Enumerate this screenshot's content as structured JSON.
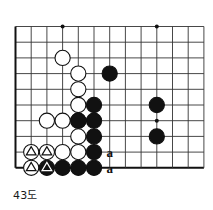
{
  "diagram": {
    "caption": "43도",
    "kind": "go-board-diagram",
    "board": {
      "cols": 12,
      "rows": 10,
      "origin_x": 15.5,
      "origin_y": 26.5,
      "spacing": 15.7,
      "line_color": "#333333",
      "edge_color": "#111111",
      "edge_width": 2.0,
      "line_width": 0.9,
      "edges": {
        "left": true,
        "top": false,
        "right": false,
        "bottom": true
      },
      "star_points": [
        {
          "col": 3,
          "row": 0
        },
        {
          "col": 9,
          "row": 0
        },
        {
          "col": 9,
          "row": 6
        }
      ],
      "star_radius": 2.0,
      "star_color": "#111111"
    },
    "stones": {
      "white_fill": "#ffffff",
      "white_stroke": "#111111",
      "black_fill": "#111111",
      "black_stroke": "#111111",
      "radius": 7.6,
      "list": [
        {
          "col": 3,
          "row": 2,
          "color": "white",
          "mark": "none"
        },
        {
          "col": 4,
          "row": 3,
          "color": "white",
          "mark": "none"
        },
        {
          "col": 4,
          "row": 4,
          "color": "white",
          "mark": "none"
        },
        {
          "col": 4,
          "row": 5,
          "color": "white",
          "mark": "none"
        },
        {
          "col": 4,
          "row": 6,
          "color": "white",
          "mark": "none"
        },
        {
          "col": 4,
          "row": 7,
          "color": "white",
          "mark": "none"
        },
        {
          "col": 3,
          "row": 6,
          "color": "white",
          "mark": "none"
        },
        {
          "col": 2,
          "row": 6,
          "color": "white",
          "mark": "none"
        },
        {
          "col": 4,
          "row": 8,
          "color": "white",
          "mark": "none"
        },
        {
          "col": 1,
          "row": 8,
          "color": "white",
          "mark": "triangle"
        },
        {
          "col": 2,
          "row": 8,
          "color": "white",
          "mark": "triangle"
        },
        {
          "col": 3,
          "row": 8,
          "color": "white",
          "mark": "none"
        },
        {
          "col": 1,
          "row": 9,
          "color": "white",
          "mark": "triangle"
        },
        {
          "col": 2,
          "row": 9,
          "color": "black",
          "mark": "triangle"
        },
        {
          "col": 3,
          "row": 9,
          "color": "black",
          "mark": "none"
        },
        {
          "col": 4,
          "row": 9,
          "color": "black",
          "mark": "none"
        },
        {
          "col": 6,
          "row": 3,
          "color": "black",
          "mark": "none"
        },
        {
          "col": 5,
          "row": 5,
          "color": "black",
          "mark": "none"
        },
        {
          "col": 5,
          "row": 6,
          "color": "black",
          "mark": "none"
        },
        {
          "col": 4,
          "row": 6,
          "color": "black",
          "mark": "none"
        },
        {
          "col": 5,
          "row": 7,
          "color": "black",
          "mark": "none"
        },
        {
          "col": 5,
          "row": 8,
          "color": "black",
          "mark": "none"
        },
        {
          "col": 5,
          "row": 9,
          "color": "black",
          "mark": "none"
        },
        {
          "col": 9,
          "row": 5,
          "color": "black",
          "mark": "none"
        },
        {
          "col": 9,
          "row": 7,
          "color": "black",
          "mark": "none"
        }
      ]
    },
    "labels": [
      {
        "text": "a",
        "col": 6,
        "row": 8
      },
      {
        "text": "a",
        "col": 6,
        "row": 9
      }
    ]
  }
}
